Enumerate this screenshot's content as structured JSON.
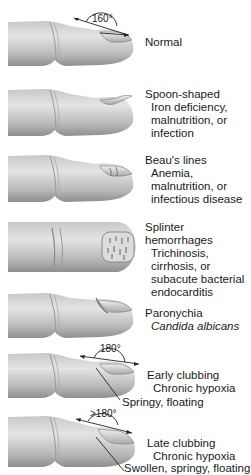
{
  "figure": {
    "type": "nail-abnormalities-diagram",
    "rows": [
      {
        "id": "normal",
        "title": "Normal",
        "angle": "160°",
        "sub_lines": []
      },
      {
        "id": "spoon",
        "title": "Spoon-shaped",
        "sub_lines": [
          "Iron deficiency,",
          "malnutrition, or",
          "infection"
        ]
      },
      {
        "id": "beaus",
        "title": "Beau's lines",
        "sub_lines": [
          "Anemia,",
          "malnutrition, or",
          "infectious disease"
        ]
      },
      {
        "id": "splinter",
        "title_lines": [
          "Splinter",
          "hemorrhages"
        ],
        "sub_lines": [
          "Trichinosis,",
          "cirrhosis, or",
          "subacute bacterial",
          "endocarditis"
        ]
      },
      {
        "id": "paronychia",
        "title": "Paronychia",
        "sub_lines_italic": [
          "Candida albicans"
        ]
      },
      {
        "id": "early-clubbing",
        "title": "Early clubbing",
        "angle": "180°",
        "sub_lines": [
          "Chronic hypoxia"
        ],
        "callout": "Springy, floating"
      },
      {
        "id": "late-clubbing",
        "title": "Late clubbing",
        "angle": ">180°",
        "sub_lines": [
          "Chronic hypoxia"
        ],
        "callout": "Swollen, springy, floating"
      }
    ]
  },
  "colors": {
    "skin_light": "#e6e6e6",
    "skin_mid": "#bdbdbd",
    "skin_dark": "#8a8a8a",
    "nail": "#d0d0d0",
    "line": "#222222",
    "background": "#ffffff"
  }
}
